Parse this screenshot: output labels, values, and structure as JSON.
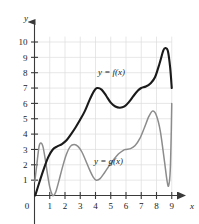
{
  "chart_data": {
    "type": "line",
    "title": "",
    "xlabel": "x",
    "ylabel": "y",
    "xlim": [
      0,
      9.6
    ],
    "ylim": [
      0,
      10.6
    ],
    "grid": true,
    "legend_position": "inline-annotation",
    "x_ticks": [
      "1",
      "2",
      "3",
      "4",
      "5",
      "6",
      "7",
      "8",
      "9"
    ],
    "y_ticks": [
      "1",
      "2",
      "3",
      "4",
      "5",
      "6",
      "7",
      "8",
      "9",
      "10"
    ],
    "origin_label": "0",
    "series": [
      {
        "name": "y = f(x)",
        "color": "#1a1a1a",
        "width": 2.1,
        "x": [
          0.05,
          0.3,
          0.6,
          0.9,
          1.2,
          1.5,
          1.8,
          2.1,
          2.4,
          2.7,
          3.0,
          3.3,
          3.6,
          3.9,
          4.1,
          4.4,
          4.7,
          5.0,
          5.3,
          5.6,
          5.9,
          6.2,
          6.5,
          6.8,
          7.0,
          7.3,
          7.6,
          7.9,
          8.2,
          8.45,
          8.6,
          8.75,
          8.9,
          9.0
        ],
        "y": [
          0.0,
          0.8,
          1.7,
          2.5,
          3.0,
          3.2,
          3.35,
          3.6,
          4.0,
          4.45,
          4.95,
          5.5,
          6.2,
          6.8,
          7.0,
          6.9,
          6.5,
          6.05,
          5.8,
          5.72,
          5.8,
          6.1,
          6.5,
          6.85,
          7.0,
          7.1,
          7.3,
          7.7,
          8.6,
          9.45,
          9.6,
          9.4,
          8.3,
          7.0
        ]
      },
      {
        "name": "y = g(x)",
        "color": "#8c8c8c",
        "width": 1.5,
        "x": [
          0.02,
          0.15,
          0.3,
          0.42,
          0.55,
          0.7,
          0.85,
          1.0,
          1.15,
          1.25,
          1.4,
          1.6,
          1.85,
          2.1,
          2.35,
          2.6,
          2.85,
          3.1,
          3.35,
          3.6,
          3.85,
          4.05,
          4.3,
          4.6,
          4.9,
          5.2,
          5.5,
          5.8,
          6.0,
          6.3,
          6.6,
          6.9,
          7.2,
          7.5,
          7.75,
          8.0,
          8.25,
          8.5,
          8.7,
          8.8,
          8.9,
          8.97,
          9.0
        ],
        "y": [
          0.9,
          2.0,
          3.2,
          3.42,
          3.2,
          2.4,
          1.4,
          0.55,
          0.08,
          0.0,
          0.25,
          0.95,
          1.9,
          2.7,
          3.2,
          3.32,
          3.2,
          2.85,
          2.3,
          1.7,
          1.2,
          1.0,
          1.1,
          1.5,
          1.95,
          2.35,
          2.7,
          2.93,
          3.0,
          3.05,
          3.25,
          3.7,
          4.4,
          5.15,
          5.5,
          5.2,
          4.2,
          2.4,
          0.9,
          0.65,
          1.6,
          4.2,
          6.0
        ]
      }
    ],
    "annotations": [
      {
        "text": "y = f(x)",
        "x": 5.05,
        "y": 7.85
      },
      {
        "text": "y = g(x)",
        "x": 4.85,
        "y": 2.05
      }
    ]
  },
  "axes": {
    "y_axis_name": "y",
    "x_axis_name": "x",
    "y_arrow": "arrow-up",
    "x_arrow": "arrow-right"
  }
}
